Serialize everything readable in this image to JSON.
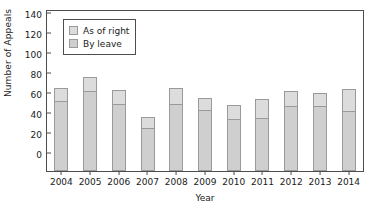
{
  "chart_data": {
    "type": "bar",
    "stacked": true,
    "title": "",
    "xlabel": "Year",
    "ylabel": "Number of Appeals",
    "categories": [
      "2004",
      "2005",
      "2006",
      "2007",
      "2008",
      "2009",
      "2010",
      "2011",
      "2012",
      "2013",
      "2014"
    ],
    "series": [
      {
        "name": "By leave",
        "color": "#cfcfcf",
        "values": [
          70,
          80,
          67,
          43,
          67,
          61,
          52,
          53,
          65,
          65,
          60
        ]
      },
      {
        "name": "As of right",
        "color": "#dcdcdc",
        "values": [
          13,
          14,
          14,
          11,
          16,
          12,
          14,
          19,
          15,
          13,
          22
        ]
      }
    ],
    "totals": [
      83,
      94,
      81,
      54,
      83,
      73,
      66,
      72,
      80,
      78,
      82
    ],
    "ylim": [
      0,
      160
    ],
    "yticks": [
      0,
      20,
      40,
      60,
      80,
      100,
      120,
      140,
      160
    ],
    "ytick_labels": [
      "0",
      "20",
      "40",
      "60",
      "80",
      "100",
      "120",
      "140",
      "160"
    ],
    "grid": false,
    "legend_position": "top-left",
    "legend_order": [
      "As of right",
      "By leave"
    ],
    "axis_color": "#4d4d4d",
    "bar_edge_color": "#9a9a9a",
    "background": "#ffffff"
  },
  "legend": {
    "items": [
      {
        "label": "As of right",
        "color": "#dcdcdc"
      },
      {
        "label": "By leave",
        "color": "#cfcfcf"
      }
    ]
  }
}
